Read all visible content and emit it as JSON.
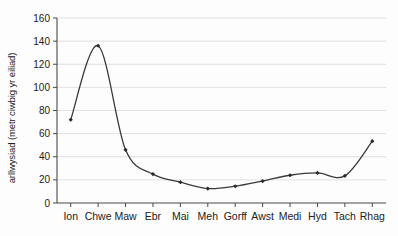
{
  "chart_data": {
    "type": "line",
    "title": "",
    "subtitle": "",
    "xlabel": "",
    "ylabel": "arllwysiad (metr ciwbig yr eiliad)",
    "categories": [
      "Ion",
      "Chwe",
      "Maw",
      "Ebr",
      "Mai",
      "Meh",
      "Gorff",
      "Awst",
      "Medi",
      "Hyd",
      "Tach",
      "Rhag"
    ],
    "values": [
      72,
      136,
      46,
      25,
      18,
      12.5,
      14.5,
      19,
      24,
      26,
      23.5,
      53.5
    ],
    "series": [
      {
        "name": "arllwysiad",
        "values": [
          72,
          136,
          46,
          25,
          18,
          12.5,
          14.5,
          19,
          24,
          26,
          23.5,
          53.5
        ]
      }
    ],
    "ylim": [
      0,
      160
    ],
    "yticks": [
      0,
      20,
      40,
      60,
      80,
      100,
      120,
      140,
      160
    ],
    "ytick_labels": [
      "0",
      "20",
      "40",
      "60",
      "80",
      "100",
      "120",
      "140",
      "160"
    ],
    "grid": true,
    "grid_axis": "y",
    "legend": false,
    "legend_position": "none",
    "marker": "diamond",
    "line_color": "#3a3a3a",
    "marker_color": "#2a2a2a",
    "grid_color": "#d9d9dd",
    "axis_color": "#4a4a4a",
    "background_color": "#fdfdfd",
    "smooth": true,
    "annotations": []
  }
}
